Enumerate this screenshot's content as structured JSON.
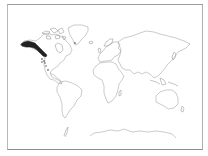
{
  "map": {
    "type": "world-outline-distribution-map",
    "projection": "equirectangular-like",
    "background_color": "#ffffff",
    "outline_color": "#a8a8a8",
    "frame_color": "#9a9a9a",
    "highlight": {
      "label": "distribution-range",
      "region": "Western North America (Alaska, British Columbia, Pacific Northwest coast)",
      "color": "#222222"
    },
    "scattered_points": {
      "region": "Western United States / Mexico",
      "color": "#333333",
      "count": 7
    },
    "continents": [
      "North America",
      "Greenland",
      "South America",
      "Europe",
      "Africa",
      "Asia",
      "Australia",
      "Antarctica"
    ]
  }
}
